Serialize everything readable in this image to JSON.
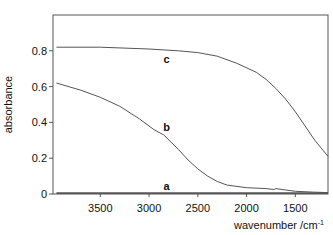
{
  "chart_data": {
    "type": "line",
    "title": "",
    "xlabel": "wavenumber /cm",
    "xlabel_superscript": "-1",
    "ylabel": "absorbance",
    "xlim": [
      3985,
      1165
    ],
    "ylim": [
      0,
      1.0
    ],
    "x_reversed": true,
    "grid": false,
    "legend": "none; curves labeled inline",
    "x_ticks": [
      3500,
      3000,
      2500,
      2000,
      1500
    ],
    "x_tick_labels": [
      "3500",
      "3000",
      "2500",
      "2000",
      "1500"
    ],
    "y_ticks": [
      0,
      0.2,
      0.4,
      0.6,
      0.8
    ],
    "y_tick_labels": [
      "0",
      "0.2",
      "0.4",
      "0.6",
      "0.8"
    ],
    "series": [
      {
        "name": "a",
        "label_pos": [
          2820,
          0.02
        ],
        "x": [
          3950,
          3500,
          3000,
          2500,
          2000,
          1700,
          1500,
          1165
        ],
        "y": [
          0.005,
          0.005,
          0.005,
          0.005,
          0.005,
          0.005,
          0.005,
          0.005
        ]
      },
      {
        "name": "b",
        "label_pos": [
          2820,
          0.35
        ],
        "x": [
          3950,
          3700,
          3500,
          3300,
          3100,
          2950,
          2850,
          2700,
          2600,
          2500,
          2400,
          2300,
          2200,
          2000,
          1800,
          1720,
          1700,
          1500,
          1300,
          1165
        ],
        "y": [
          0.62,
          0.58,
          0.54,
          0.49,
          0.42,
          0.36,
          0.33,
          0.25,
          0.19,
          0.14,
          0.1,
          0.07,
          0.05,
          0.035,
          0.03,
          0.025,
          0.03,
          0.015,
          0.01,
          0.008
        ]
      },
      {
        "name": "c",
        "label_pos": [
          2820,
          0.73
        ],
        "x": [
          3950,
          3500,
          3000,
          2700,
          2500,
          2300,
          2100,
          1900,
          1800,
          1720,
          1700,
          1600,
          1500,
          1400,
          1300,
          1165
        ],
        "y": [
          0.82,
          0.82,
          0.81,
          0.8,
          0.79,
          0.77,
          0.73,
          0.68,
          0.64,
          0.6,
          0.59,
          0.53,
          0.46,
          0.38,
          0.3,
          0.21
        ]
      }
    ]
  }
}
